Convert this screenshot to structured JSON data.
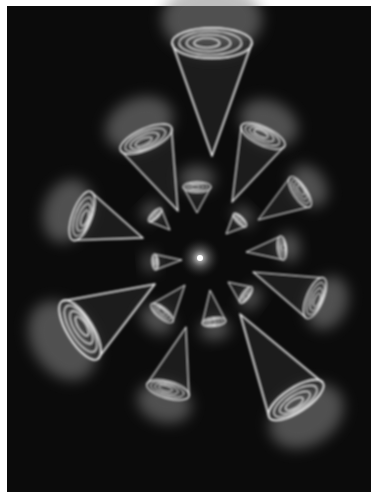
{
  "image": {
    "description": "Abstract artwork of glowing white outlined cones with spiral rings radiating around a central point on a black background",
    "background_color": "#0b0b0b",
    "frame_color": "#ffffff",
    "stroke_color": "#f2f2f2",
    "glow_color": "#8a8a8a",
    "center": [
      200,
      258
    ]
  },
  "cones": [
    {
      "tip": [
        212,
        156
      ],
      "base": [
        212,
        43
      ],
      "radius": 40,
      "scale": 1.0
    },
    {
      "tip": [
        178,
        211
      ],
      "base": [
        146,
        139
      ],
      "radius": 28,
      "scale": 0.8
    },
    {
      "tip": [
        232,
        202
      ],
      "base": [
        263,
        136
      ],
      "radius": 24,
      "scale": 0.75
    },
    {
      "tip": [
        143,
        238
      ],
      "base": [
        82,
        216
      ],
      "radius": 26,
      "scale": 0.8
    },
    {
      "tip": [
        258,
        220
      ],
      "base": [
        300,
        192
      ],
      "radius": 18,
      "scale": 0.6
    },
    {
      "tip": [
        197,
        213
      ],
      "base": [
        197,
        187
      ],
      "radius": 14,
      "scale": 0.45
    },
    {
      "tip": [
        170,
        230
      ],
      "base": [
        155,
        215
      ],
      "radius": 9,
      "scale": 0.3
    },
    {
      "tip": [
        226,
        234
      ],
      "base": [
        240,
        220
      ],
      "radius": 9,
      "scale": 0.3
    },
    {
      "tip": [
        246,
        252
      ],
      "base": [
        282,
        248
      ],
      "radius": 12,
      "scale": 0.4
    },
    {
      "tip": [
        182,
        260
      ],
      "base": [
        155,
        262
      ],
      "radius": 8,
      "scale": 0.3
    },
    {
      "tip": [
        155,
        284
      ],
      "base": [
        80,
        330
      ],
      "radius": 34,
      "scale": 1.0
    },
    {
      "tip": [
        185,
        285
      ],
      "base": [
        162,
        313
      ],
      "radius": 14,
      "scale": 0.45
    },
    {
      "tip": [
        210,
        290
      ],
      "base": [
        214,
        322
      ],
      "radius": 12,
      "scale": 0.4
    },
    {
      "tip": [
        228,
        282
      ],
      "base": [
        246,
        295
      ],
      "radius": 10,
      "scale": 0.35
    },
    {
      "tip": [
        253,
        272
      ],
      "base": [
        315,
        298
      ],
      "radius": 22,
      "scale": 0.7
    },
    {
      "tip": [
        186,
        327
      ],
      "base": [
        168,
        390
      ],
      "radius": 22,
      "scale": 0.7
    },
    {
      "tip": [
        240,
        314
      ],
      "base": [
        296,
        400
      ],
      "radius": 32,
      "scale": 1.0
    }
  ]
}
